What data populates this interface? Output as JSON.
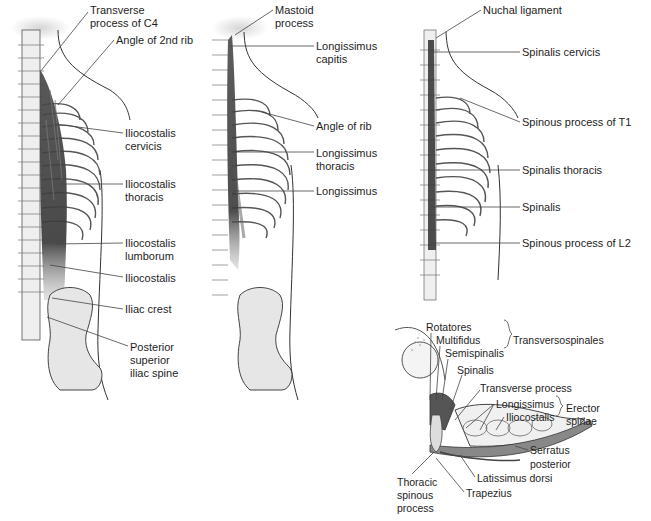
{
  "figure": {
    "panels": [
      {
        "id": "iliocostalis",
        "labels": [
          {
            "text": "Transverse",
            "x": 90,
            "y": 4
          },
          {
            "text": "process of C4",
            "x": 90,
            "y": 17
          },
          {
            "text": "Angle of 2nd rib",
            "x": 116,
            "y": 34
          },
          {
            "text": "Iliocostalis",
            "x": 125,
            "y": 127
          },
          {
            "text": "cervicis",
            "x": 125,
            "y": 140
          },
          {
            "text": "Iliocostalis",
            "x": 125,
            "y": 178
          },
          {
            "text": "thoracis",
            "x": 125,
            "y": 191
          },
          {
            "text": "Iliocostalis",
            "x": 125,
            "y": 237
          },
          {
            "text": "lumborum",
            "x": 125,
            "y": 250
          },
          {
            "text": "Iliocostalis",
            "x": 125,
            "y": 272
          },
          {
            "text": "Iliac crest",
            "x": 125,
            "y": 303
          },
          {
            "text": "Posterior",
            "x": 130,
            "y": 341
          },
          {
            "text": "superior",
            "x": 130,
            "y": 354
          },
          {
            "text": "iliac spine",
            "x": 130,
            "y": 367
          }
        ]
      },
      {
        "id": "longissimus",
        "labels": [
          {
            "text": "Mastoid",
            "x": 275,
            "y": 4
          },
          {
            "text": "process",
            "x": 275,
            "y": 17
          },
          {
            "text": "Longissimus",
            "x": 316,
            "y": 40
          },
          {
            "text": "capitis",
            "x": 316,
            "y": 53
          },
          {
            "text": "Angle of rib",
            "x": 316,
            "y": 120
          },
          {
            "text": "Longissimus",
            "x": 316,
            "y": 147
          },
          {
            "text": "thoracis",
            "x": 316,
            "y": 160
          },
          {
            "text": "Longissimus",
            "x": 316,
            "y": 185
          }
        ]
      },
      {
        "id": "spinalis",
        "labels": [
          {
            "text": "Nuchal ligament",
            "x": 483,
            "y": 4
          },
          {
            "text": "Spinalis cervicis",
            "x": 522,
            "y": 46
          },
          {
            "text": "Spinous process of T1",
            "x": 522,
            "y": 116
          },
          {
            "text": "Spinalis thoracis",
            "x": 522,
            "y": 164
          },
          {
            "text": "Spinalis",
            "x": 522,
            "y": 201
          },
          {
            "text": "Spinous process of L2",
            "x": 522,
            "y": 237
          }
        ]
      },
      {
        "id": "cross-section",
        "labels": [
          {
            "text": "Rotatores",
            "x": 426,
            "y": 321
          },
          {
            "text": "Multifidus",
            "x": 436,
            "y": 334
          },
          {
            "text": "Semispinalis",
            "x": 445,
            "y": 347
          },
          {
            "text": "Transversospinales",
            "x": 513,
            "y": 334
          },
          {
            "text": "Spinalis",
            "x": 457,
            "y": 364
          },
          {
            "text": "Transverse process",
            "x": 480,
            "y": 382
          },
          {
            "text": "Longissimus",
            "x": 496,
            "y": 398
          },
          {
            "text": "Iliocostalis",
            "x": 506,
            "y": 411
          },
          {
            "text": "Erector",
            "x": 566,
            "y": 402
          },
          {
            "text": "spinae",
            "x": 566,
            "y": 415
          },
          {
            "text": "Serratus",
            "x": 530,
            "y": 444
          },
          {
            "text": "posterior",
            "x": 530,
            "y": 458
          },
          {
            "text": "Latissimus dorsi",
            "x": 477,
            "y": 472
          },
          {
            "text": "Thoracic",
            "x": 397,
            "y": 476
          },
          {
            "text": "spinous",
            "x": 397,
            "y": 489
          },
          {
            "text": "process",
            "x": 397,
            "y": 502
          },
          {
            "text": "Trapezius",
            "x": 466,
            "y": 487
          }
        ]
      }
    ],
    "colors": {
      "muscle_dark": "#3a3a3a",
      "muscle_mid": "#6b6b6b",
      "bone_fill": "#e8e8e8",
      "bone_shade": "#c9c9c9",
      "outline": "#333333",
      "leader_line": "#444444"
    }
  }
}
